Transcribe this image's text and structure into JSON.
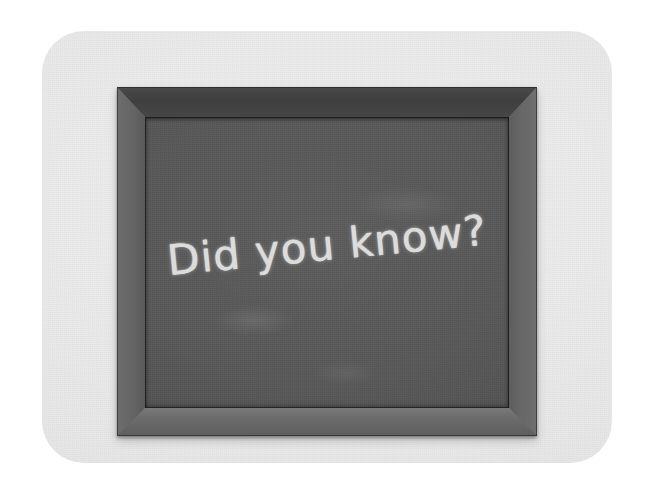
{
  "scene": {
    "kind": "chalkboard-photo",
    "background_color": "#ffffff",
    "card": {
      "name": "rounded-card",
      "color": "#ececec",
      "corner_radius_px": 42
    },
    "frame": {
      "name": "wooden-picture-frame",
      "style": "mitred",
      "rail_colors": {
        "top": "#424242",
        "left": "#656565",
        "right": "#666666",
        "bottom": "#6e6e6e"
      }
    },
    "board": {
      "name": "slate-writing-surface",
      "color": "#565656"
    }
  },
  "chalk": {
    "message": "Did you know?",
    "color": "#e6e6e4",
    "rotation_degrees": -5.5
  }
}
